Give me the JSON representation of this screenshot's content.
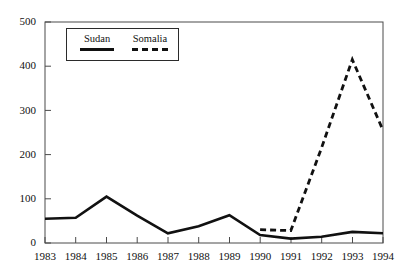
{
  "chart_data": {
    "type": "line",
    "title": "",
    "xlabel": "",
    "ylabel": "",
    "x": [
      1983,
      1984,
      1985,
      1986,
      1987,
      1988,
      1989,
      1990,
      1991,
      1992,
      1993,
      1994
    ],
    "categories": [
      "1983",
      "1984",
      "1985",
      "1986",
      "1987",
      "1988",
      "1989",
      "1990",
      "1991",
      "1992",
      "1993",
      "1994"
    ],
    "xlim": [
      1983,
      1994
    ],
    "ylim": [
      0,
      500
    ],
    "yticks": [
      0,
      100,
      200,
      300,
      400,
      500
    ],
    "ytick_labels": [
      "0",
      "100",
      "200",
      "300",
      "400",
      "500"
    ],
    "grid": false,
    "legend_position": "upper-left-inside",
    "series": [
      {
        "name": "Sudan",
        "style": "solid",
        "color": "#111111",
        "x": [
          1983,
          1984,
          1985,
          1986,
          1987,
          1988,
          1989,
          1990,
          1991,
          1992,
          1993,
          1994
        ],
        "values": [
          55,
          57,
          105,
          62,
          22,
          38,
          63,
          18,
          10,
          14,
          25,
          22
        ]
      },
      {
        "name": "Somalia",
        "style": "dashed",
        "color": "#111111",
        "x": [
          1990,
          1991,
          1992,
          1993,
          1994
        ],
        "values": [
          30,
          28,
          215,
          415,
          255
        ]
      }
    ]
  },
  "legend": {
    "entries": [
      {
        "label": "Sudan",
        "style": "solid"
      },
      {
        "label": "Somalia",
        "style": "dashed"
      }
    ]
  },
  "axes": {
    "y_labels": [
      "500",
      "400",
      "300",
      "200",
      "100",
      "0"
    ],
    "x_labels": [
      "1983",
      "1984",
      "1985",
      "1986",
      "1987",
      "1988",
      "1989",
      "1990",
      "1991",
      "1992",
      "1993",
      "1994"
    ]
  }
}
